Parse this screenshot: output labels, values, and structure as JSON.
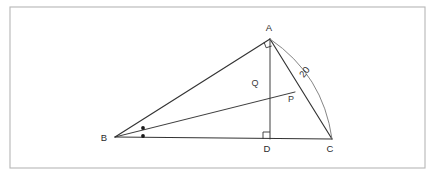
{
  "figure": {
    "kind": "euclidean-geometry-diagram",
    "frame": {
      "x": 10,
      "y": 7,
      "width": 415,
      "height": 161,
      "color": "#b6b6b6"
    },
    "ink_color": "#333333",
    "arc_color": "#777777",
    "points": [
      {
        "id": "A",
        "label": "A",
        "x": 270,
        "y": 39,
        "label_x": 269,
        "label_y": 31
      },
      {
        "id": "B",
        "label": "B",
        "x": 115,
        "y": 137,
        "label_x": 104,
        "label_y": 141
      },
      {
        "id": "C",
        "label": "C",
        "x": 332,
        "y": 139,
        "label_x": 330,
        "label_y": 152
      },
      {
        "id": "D",
        "label": "D",
        "x": 270,
        "y": 139,
        "label_x": 267,
        "label_y": 152
      },
      {
        "id": "P",
        "label": "P",
        "x": 295,
        "y": 92,
        "label_x": 291,
        "label_y": 102
      },
      {
        "id": "Q",
        "label": "Q",
        "x": 265,
        "y": 88,
        "label_x": 255,
        "label_y": 86
      }
    ],
    "segments": [
      {
        "id": "AB",
        "from": "B",
        "to": "A",
        "weight": "main"
      },
      {
        "id": "BC",
        "from": "B",
        "to": "C",
        "weight": "main"
      },
      {
        "id": "AC",
        "from": "A",
        "to": "C",
        "weight": "main"
      },
      {
        "id": "AD",
        "from": "A",
        "to": "D",
        "weight": "thin"
      },
      {
        "id": "BP",
        "from": "B",
        "to": "P",
        "weight": "thin"
      }
    ],
    "arc": {
      "id": "arc-AC",
      "from": "A",
      "to": "C",
      "bulge": "outward-right",
      "measure_label": "20",
      "label_x": 307,
      "label_y": 74
    },
    "right_angles": [
      {
        "id": "right-angle-at-D",
        "at": "D",
        "x": 263,
        "y": 132,
        "size": 7
      },
      {
        "id": "right-angle-at-A",
        "at": "A",
        "x": 265,
        "y": 39,
        "size": 7
      }
    ],
    "angle_marks": [
      {
        "id": "angle-dot-upper",
        "x": 143,
        "y": 128,
        "r": 1.9
      },
      {
        "id": "angle-dot-lower",
        "x": 143,
        "y": 136,
        "r": 1.9
      }
    ]
  }
}
